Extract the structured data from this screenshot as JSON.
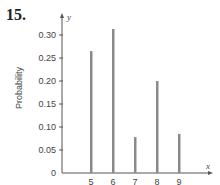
{
  "problem_number": "15.",
  "chart_data": {
    "type": "bar",
    "title": "",
    "xlabel": "x",
    "ylabel": "Probability",
    "y_axis_var": "y",
    "categories": [
      "5",
      "6",
      "7",
      "8",
      "9"
    ],
    "values": [
      0.265,
      0.313,
      0.078,
      0.2,
      0.085
    ],
    "yticks": [
      "0",
      "0.05",
      "0.10",
      "0.15",
      "0.20",
      "0.25",
      "0.30"
    ],
    "ylim": [
      0,
      0.32
    ],
    "grid": false,
    "legend": null,
    "colors": {
      "bar": "#8a8a8a",
      "axis": "#555555"
    }
  }
}
